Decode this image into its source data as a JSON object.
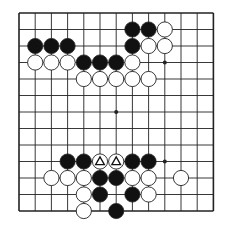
{
  "board": {
    "cols": 13,
    "rows": 13,
    "origin_x": 19,
    "origin_y": 13,
    "spacing_x": 16.2,
    "spacing_y": 16.5,
    "stone_radius": 7.6,
    "colors": {
      "background": "#ffffff",
      "line": "#222222",
      "black_stone": "#111111",
      "white_stone": "#ffffff",
      "stone_outline": "#222222",
      "marker": "#111111"
    },
    "star_points": [
      [
        9,
        3
      ],
      [
        6,
        6
      ],
      [
        9,
        9
      ]
    ],
    "black_stones": [
      [
        7,
        1
      ],
      [
        8,
        1
      ],
      [
        1,
        2
      ],
      [
        2,
        2
      ],
      [
        3,
        2
      ],
      [
        7,
        2
      ],
      [
        4,
        3
      ],
      [
        5,
        3
      ],
      [
        6,
        3
      ],
      [
        3,
        9
      ],
      [
        4,
        9
      ],
      [
        7,
        9
      ],
      [
        8,
        9
      ],
      [
        5,
        10
      ],
      [
        6,
        10
      ],
      [
        5,
        11
      ],
      [
        7,
        11
      ],
      [
        6,
        12
      ]
    ],
    "white_stones": [
      [
        9,
        1
      ],
      [
        8,
        2
      ],
      [
        9,
        2
      ],
      [
        1,
        3
      ],
      [
        2,
        3
      ],
      [
        3,
        3
      ],
      [
        7,
        3
      ],
      [
        4,
        4
      ],
      [
        5,
        4
      ],
      [
        6,
        4
      ],
      [
        7,
        4
      ],
      [
        8,
        4
      ],
      [
        5,
        9
      ],
      [
        6,
        9
      ],
      [
        2,
        10
      ],
      [
        3,
        10
      ],
      [
        4,
        10
      ],
      [
        7,
        10
      ],
      [
        8,
        10
      ],
      [
        10,
        10
      ],
      [
        4,
        11
      ],
      [
        8,
        11
      ],
      [
        4,
        12
      ]
    ],
    "markers": [
      {
        "type": "triangle",
        "pos": [
          5,
          9
        ],
        "on": "white"
      },
      {
        "type": "triangle",
        "pos": [
          6,
          9
        ],
        "on": "white"
      }
    ]
  }
}
